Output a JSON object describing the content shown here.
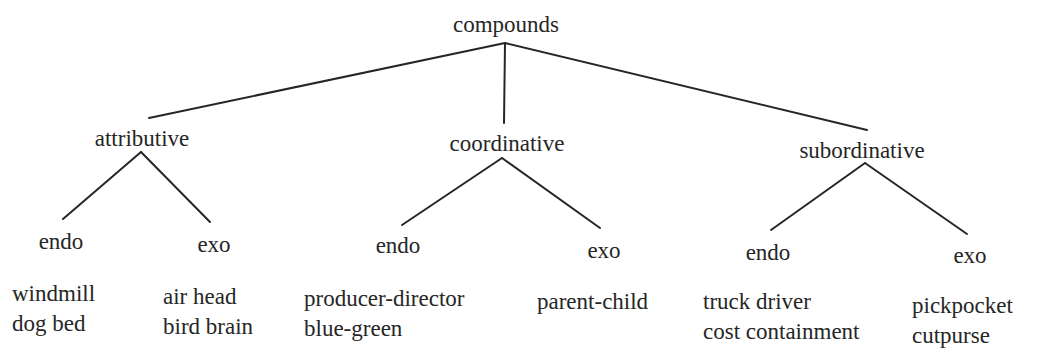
{
  "root": {
    "label": "compounds"
  },
  "categories": [
    {
      "label": "attributive",
      "endo": {
        "label": "endo",
        "examples": [
          "windmill",
          "dog bed"
        ]
      },
      "exo": {
        "label": "exo",
        "examples": [
          "air head",
          "bird brain"
        ]
      }
    },
    {
      "label": "coordinative",
      "endo": {
        "label": "endo",
        "examples": [
          "producer-director",
          "blue-green"
        ]
      },
      "exo": {
        "label": "exo",
        "examples": [
          "parent-child"
        ]
      }
    },
    {
      "label": "subordinative",
      "endo": {
        "label": "endo",
        "examples": [
          "truck driver",
          "cost containment"
        ]
      },
      "exo": {
        "label": "exo",
        "examples": [
          "pickpocket",
          "cutpurse"
        ]
      }
    }
  ],
  "colors": {
    "ink": "#262626",
    "background": "#ffffff"
  }
}
